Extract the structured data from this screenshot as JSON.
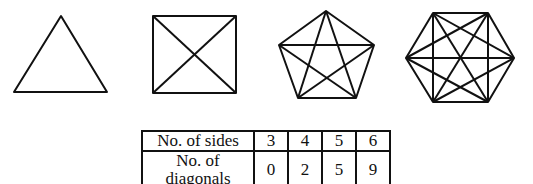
{
  "shapes": [
    {
      "name": "triangle",
      "sides": 3
    },
    {
      "name": "square",
      "sides": 4
    },
    {
      "name": "pentagon",
      "sides": 5
    },
    {
      "name": "hexagon",
      "sides": 6
    }
  ],
  "table": {
    "rows": [
      {
        "label": "No. of sides",
        "values": [
          "3",
          "4",
          "5",
          "6"
        ]
      },
      {
        "label": "No. of diagonals",
        "values": [
          "0",
          "2",
          "5",
          "9"
        ]
      }
    ]
  },
  "colors": {
    "stroke": "#111111",
    "background": "#ffffff"
  }
}
